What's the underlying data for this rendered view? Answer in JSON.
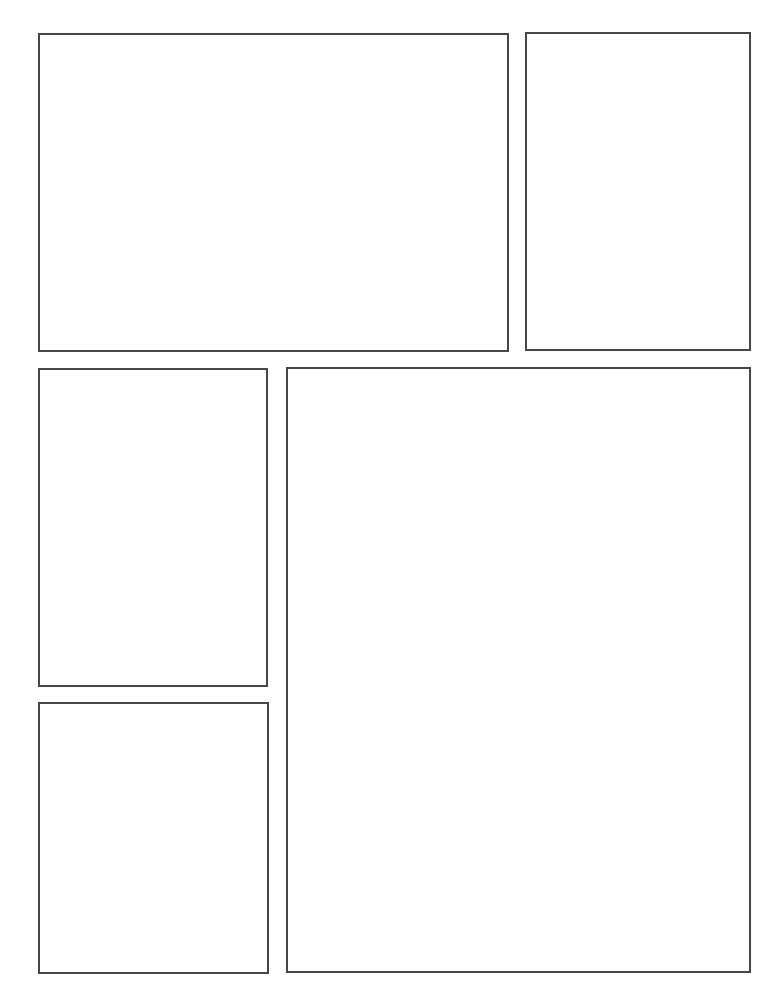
{
  "page": {
    "type": "comic-page-template",
    "background": "#ffffff",
    "border_color": "#474747",
    "panel_count": 5
  },
  "panels": [
    {
      "id": "panel-1",
      "x": 38,
      "y": 33,
      "w": 471,
      "h": 319,
      "content": ""
    },
    {
      "id": "panel-2",
      "x": 525,
      "y": 32,
      "w": 226,
      "h": 319,
      "content": ""
    },
    {
      "id": "panel-3",
      "x": 38,
      "y": 368,
      "w": 230,
      "h": 319,
      "content": ""
    },
    {
      "id": "panel-4",
      "x": 38,
      "y": 702,
      "w": 231,
      "h": 272,
      "content": ""
    },
    {
      "id": "panel-5",
      "x": 286,
      "y": 367,
      "w": 465,
      "h": 606,
      "content": ""
    }
  ]
}
